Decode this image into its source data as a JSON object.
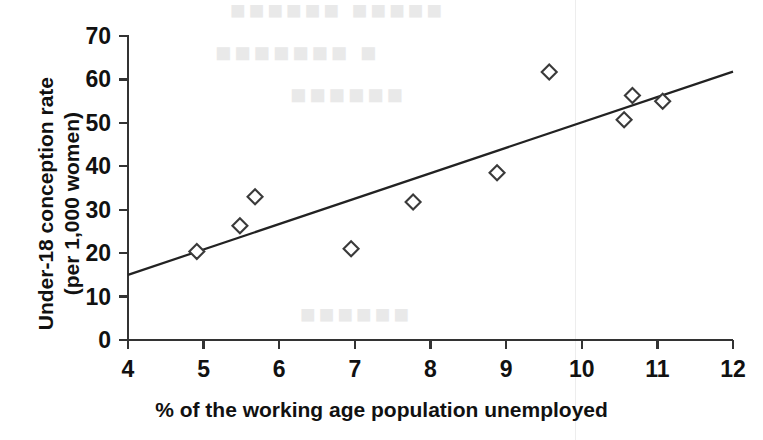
{
  "chart_data": {
    "type": "scatter",
    "title": "",
    "xlabel": "% of the working age population unemployed",
    "ylabel": "Under-18 conception rate (per 1,000 women)",
    "ylabel_line1": "Under-18 conception rate",
    "ylabel_line2": "(per 1,000 women)",
    "xlim": [
      4,
      12
    ],
    "ylim": [
      0,
      70
    ],
    "xticks": [
      4,
      5,
      6,
      7,
      8,
      9,
      10,
      11,
      12
    ],
    "yticks": [
      0,
      10,
      20,
      30,
      40,
      50,
      60,
      70
    ],
    "xtick_labels": [
      "4",
      "5",
      "6",
      "7",
      "8",
      "9",
      "10",
      "11",
      "12"
    ],
    "ytick_labels": [
      "0",
      "10",
      "20",
      "30",
      "40",
      "50",
      "60",
      "70"
    ],
    "grid": false,
    "legend": "none",
    "marker": "diamond",
    "marker_color": "#3a3a3a",
    "marker_fill": "#ffffff",
    "line_color": "#222222",
    "axis_color": "#333333",
    "points": [
      {
        "x": 4.91,
        "y": 20.4
      },
      {
        "x": 5.48,
        "y": 26.3
      },
      {
        "x": 5.68,
        "y": 33.0
      },
      {
        "x": 6.95,
        "y": 21.0
      },
      {
        "x": 7.77,
        "y": 31.8
      },
      {
        "x": 8.88,
        "y": 38.5
      },
      {
        "x": 9.57,
        "y": 61.7
      },
      {
        "x": 10.56,
        "y": 50.7
      },
      {
        "x": 10.67,
        "y": 56.3
      },
      {
        "x": 11.07,
        "y": 55.0
      }
    ],
    "trendline": {
      "type": "linear",
      "x_start": 4,
      "y_start": 15.0,
      "x_end": 12,
      "y_end": 61.8
    }
  },
  "background_text": {
    "line1": "■■■■■■ ■■■■■",
    "line2": "■■■■■■■ ■",
    "line3": "■■■■■■",
    "line4": "■■■■■■"
  }
}
